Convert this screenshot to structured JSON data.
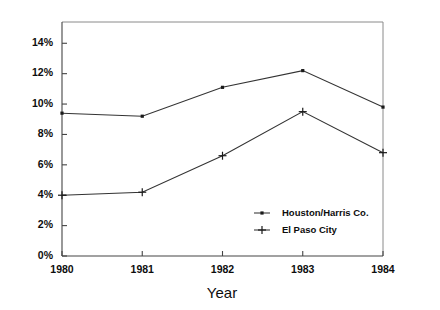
{
  "chart_data": {
    "type": "line",
    "title": "",
    "subtitle": "",
    "xlabel": "Year",
    "ylabel": "",
    "categories": [
      "1980",
      "1981",
      "1982",
      "1983",
      "1984"
    ],
    "x": [
      1980,
      1981,
      1982,
      1983,
      1984
    ],
    "xlim": [
      1980,
      1984
    ],
    "ylim": [
      0,
      15.4
    ],
    "grid": false,
    "legend_position": "inside-lower-right",
    "y_tick_labels": [
      "0%",
      "2%",
      "4%",
      "6%",
      "8%",
      "10%",
      "12%",
      "14%"
    ],
    "y_tick_values": [
      0,
      2,
      4,
      6,
      8,
      10,
      12,
      14
    ],
    "x_tick_labels": [
      "1980",
      "1981",
      "1982",
      "1983",
      "1984"
    ],
    "series": [
      {
        "name": "Houston/Harris Co.",
        "marker": "dot",
        "color": "#1a1a1a",
        "values": [
          9.4,
          9.2,
          11.1,
          12.2,
          9.8
        ]
      },
      {
        "name": "El Paso City",
        "marker": "plus",
        "color": "#1a1a1a",
        "values": [
          4.0,
          4.2,
          6.6,
          9.5,
          6.8
        ]
      }
    ]
  },
  "legend": {
    "entries": [
      {
        "label": "Houston/Harris Co.",
        "marker": "dot"
      },
      {
        "label": "El Paso City",
        "marker": "plus"
      }
    ]
  },
  "axes": {
    "x_title": "Year"
  }
}
